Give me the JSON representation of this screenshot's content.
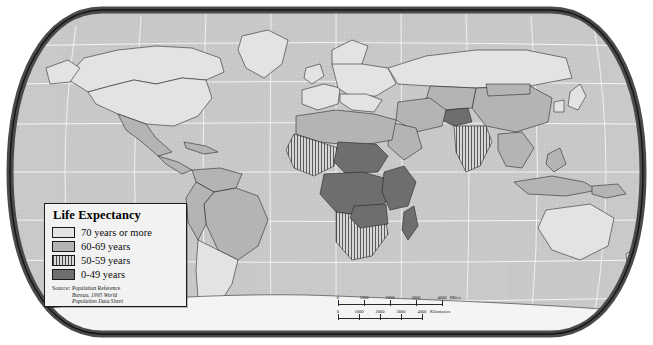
{
  "map": {
    "title": "Life Expectancy World Map",
    "projection": "robinson",
    "ocean_color": "#c9c9c9",
    "graticule_color": "#ffffff",
    "border_color": "#4a4a4a",
    "coast_color": "#1e1e1e",
    "antarctica_color": "#f4f4f4"
  },
  "legend": {
    "title": "Life Expectancy",
    "items": [
      {
        "label": "70 years or more",
        "swatch": "light-gray",
        "color": "#e3e3e3"
      },
      {
        "label": "60-69 years",
        "swatch": "medium-gray",
        "color": "#b4b4b4"
      },
      {
        "label": "50-59 years",
        "swatch": "vertical-hatch",
        "color": "#d2d2d2"
      },
      {
        "label": "0-49 years",
        "swatch": "dark-gray",
        "color": "#6e6e6e"
      }
    ],
    "source": {
      "lead": "Source:",
      "line1": "Population Reference",
      "line2": "Bureau, 1995 World",
      "line3": "Population Data Sheet"
    }
  },
  "scalebar": {
    "miles": {
      "unit": "Miles",
      "ticks": [
        "0",
        "1000",
        "2000",
        "3000",
        "4000"
      ]
    },
    "kilometers": {
      "unit": "Kilometers",
      "ticks": [
        "0",
        "1000",
        "2000",
        "3000",
        "4000"
      ]
    }
  },
  "regions": {
    "70_plus": [
      "North America",
      "Europe",
      "Australia",
      "Japan",
      "Southern South America"
    ],
    "60_69": [
      "China",
      "Brazil",
      "North Africa",
      "Southeast Asia",
      "Middle East"
    ],
    "50_59": [
      "India",
      "West Africa",
      "Southern Africa"
    ],
    "0_49": [
      "Central Africa",
      "Sahel",
      "Afghanistan",
      "East Africa"
    ]
  }
}
